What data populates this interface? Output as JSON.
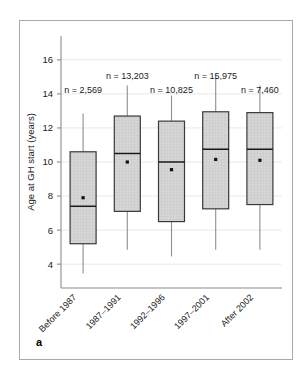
{
  "figure": {
    "panel_label": "a"
  },
  "chart_data": {
    "type": "box",
    "title": "",
    "subtitle": "",
    "xlabel": "",
    "ylabel": "Age at GH start (years)",
    "categories": [
      "Before 1987",
      "1987–1991",
      "1992–1996",
      "1997–2001",
      "After 2002"
    ],
    "ytick_labels": [
      "4",
      "6",
      "8",
      "10",
      "12",
      "14",
      "16"
    ],
    "ytick_values": [
      4,
      6,
      8,
      10,
      12,
      14,
      16
    ],
    "ylim": [
      2.6,
      17.4
    ],
    "grid": true,
    "legend": "none",
    "annotations": [
      "n = 2,569",
      "n = 13,203",
      "n = 10,825",
      "n = 15,975",
      "n = 7,460"
    ],
    "series": [
      {
        "name": "Age at GH start",
        "boxes": [
          {
            "category": "Before 1987",
            "n_label": "n = 2,569",
            "n": 2569,
            "whisker_low": 3.45,
            "q1": 5.2,
            "median": 7.4,
            "q3": 10.6,
            "whisker_high": 12.85,
            "mean": 7.9
          },
          {
            "category": "1987–1991",
            "n_label": "n = 13,203",
            "n": 13203,
            "whisker_low": 4.85,
            "q1": 7.1,
            "median": 10.5,
            "q3": 12.7,
            "whisker_high": 14.5,
            "mean": 10.0
          },
          {
            "category": "1992–1996",
            "n_label": "n = 10,825",
            "n": 10825,
            "whisker_low": 4.45,
            "q1": 6.5,
            "median": 10.0,
            "q3": 12.4,
            "whisker_high": 13.9,
            "mean": 9.55
          },
          {
            "category": "1997–2001",
            "n_label": "n = 15,975",
            "n": 15975,
            "whisker_low": 4.85,
            "q1": 7.25,
            "median": 10.75,
            "q3": 12.95,
            "whisker_high": 15.1,
            "mean": 10.15
          },
          {
            "category": "After 2002",
            "n_label": "n = 7,460",
            "n": 7460,
            "whisker_low": 4.85,
            "q1": 7.5,
            "median": 10.75,
            "q3": 12.9,
            "whisker_high": 14.5,
            "mean": 10.1
          }
        ]
      }
    ],
    "colors": {
      "box_fill": "#d2d2d2",
      "box_stroke": "#3a3a3a",
      "median": "#1a1a1a",
      "whisker": "#8f8f8f",
      "grid": "#e8e8e8",
      "axis": "#8c8c8c",
      "text": "#1a1a1a",
      "panel_border": "#a9a9a9",
      "background": "#ffffff"
    }
  }
}
